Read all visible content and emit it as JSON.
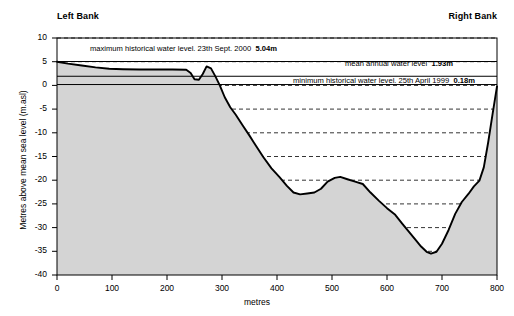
{
  "figure": {
    "left_bank_label": "Left Bank",
    "right_bank_label": "Right Bank"
  },
  "chart_data": {
    "type": "area",
    "title": "",
    "xlabel": "metres",
    "ylabel": "Metres above mean sea level (m.asl)",
    "xlim": [
      0,
      800
    ],
    "ylim": [
      -40,
      10
    ],
    "xticks": [
      0,
      100,
      200,
      300,
      400,
      500,
      600,
      700,
      800
    ],
    "yticks": [
      10,
      5,
      0,
      -5,
      -10,
      -15,
      -20,
      -25,
      -30,
      -35,
      -40
    ],
    "ytick_labels": [
      "10",
      "5",
      "0",
      "-5",
      "-10",
      "-15",
      "-20",
      "-25",
      "-30",
      "-35",
      "-40"
    ],
    "xtick_labels": [
      "0",
      "100",
      "200",
      "300",
      "400",
      "500",
      "600",
      "700",
      "800"
    ],
    "grid": "horizontal-dashed",
    "legend": "none",
    "series": [
      {
        "name": "river bed cross-section profile",
        "type": "line",
        "fill": "#d4d4d4",
        "color": "#000000",
        "x": [
          0,
          20,
          45,
          70,
          95,
          120,
          150,
          180,
          210,
          235,
          243,
          250,
          258,
          265,
          272,
          280,
          288,
          296,
          305,
          315,
          325,
          338,
          350,
          362,
          375,
          390,
          405,
          418,
          430,
          442,
          455,
          468,
          480,
          492,
          505,
          515,
          528,
          542,
          556,
          570,
          585,
          600,
          615,
          628,
          640,
          652,
          662,
          672,
          680,
          690,
          700,
          712,
          724,
          736,
          748,
          758,
          768,
          776,
          784,
          792,
          800
        ],
        "y": [
          5.0,
          4.6,
          4.2,
          3.8,
          3.5,
          3.4,
          3.35,
          3.35,
          3.35,
          3.3,
          2.6,
          1.3,
          1.2,
          2.4,
          4.0,
          3.6,
          1.9,
          0.0,
          -2.5,
          -4.6,
          -6.2,
          -8.5,
          -10.6,
          -12.8,
          -15.1,
          -17.5,
          -19.4,
          -21.2,
          -22.6,
          -23.0,
          -22.8,
          -22.6,
          -21.8,
          -20.3,
          -19.5,
          -19.3,
          -19.8,
          -20.3,
          -20.8,
          -22.6,
          -24.3,
          -25.9,
          -27.3,
          -29.2,
          -30.9,
          -32.6,
          -34.0,
          -35.1,
          -35.5,
          -35.1,
          -33.4,
          -30.5,
          -27.1,
          -24.6,
          -22.9,
          -21.3,
          -20.1,
          -17.3,
          -12.0,
          -6.0,
          -0.2
        ]
      }
    ],
    "reference_lines": [
      {
        "id": "max-historical",
        "label": "maximum historical water level. 23th Sept. 2000",
        "value_text": "5.04m",
        "value": 5.04,
        "color": "#000000",
        "label_x": 400,
        "label_anchor": "end",
        "label_y_px": 44
      },
      {
        "id": "mean-annual",
        "label": "mean annual water level",
        "value_text": "1.93m",
        "value": 1.93,
        "color": "#000000",
        "label_x": 720,
        "label_anchor": "end",
        "label_y_px": 59
      },
      {
        "id": "min-historical",
        "label": "minimum historical water level. 25th April 1999",
        "value_text": "0.18m",
        "value": 0.18,
        "color": "#000000",
        "label_x": 760,
        "label_anchor": "end",
        "label_y_px": 76
      }
    ]
  }
}
